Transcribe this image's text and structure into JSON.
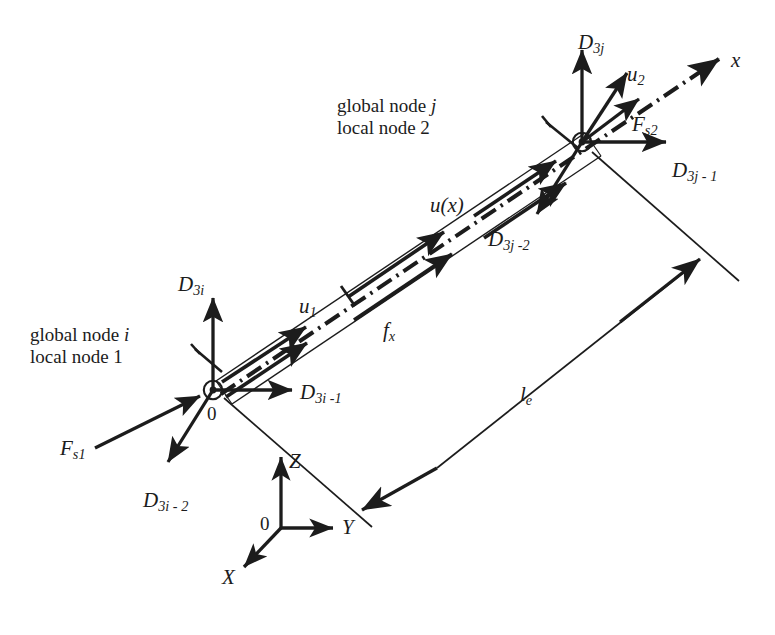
{
  "figure": {
    "background_color": "#ffffff",
    "ink_color": "#1c1c1c",
    "width": 775,
    "height": 635
  },
  "annotations": {
    "node_i_line1": "global node",
    "node_i_line1_italic": "i",
    "node_i_line2": "local node 1",
    "node_j_line1": "global node",
    "node_j_line1_italic": "j",
    "node_j_line2": "local node 2"
  },
  "labels": {
    "D3i": {
      "base": "D",
      "sub": "3i",
      "x": 178,
      "y": 272
    },
    "D3i_1": {
      "base": "D",
      "sub": "3i -1",
      "x": 300,
      "y": 380
    },
    "D3i_2": {
      "base": "D",
      "sub": "3i - 2",
      "x": 143,
      "y": 488
    },
    "Fs1": {
      "base": "F",
      "sub": "s1",
      "x": 60,
      "y": 436
    },
    "u1": {
      "base": "u",
      "sub": "1",
      "x": 299,
      "y": 294
    },
    "fx": {
      "base": "f",
      "sub": "x",
      "x": 383,
      "y": 318
    },
    "ux": {
      "base": "u(x)",
      "sub": "",
      "x": 430,
      "y": 193
    },
    "D3j": {
      "base": "D",
      "sub": "3j",
      "x": 578,
      "y": 30
    },
    "D3j_1": {
      "base": "D",
      "sub": "3j - 1",
      "x": 672,
      "y": 158
    },
    "D3j_2": {
      "base": "D",
      "sub": "3j -2",
      "x": 488,
      "y": 227
    },
    "Fs2": {
      "base": "F",
      "sub": "s2",
      "x": 632,
      "y": 112
    },
    "u2": {
      "base": "u",
      "sub": "2",
      "x": 627,
      "y": 62
    },
    "x_axis": {
      "base": "x",
      "sub": "",
      "x": 731,
      "y": 48
    },
    "le": {
      "base": "l",
      "sub": "e",
      "x": 520,
      "y": 382
    },
    "zero_left": {
      "base": "0",
      "x": 207,
      "y": 403
    },
    "zero_global": {
      "base": "0",
      "x": 260,
      "y": 513
    },
    "X_axis": {
      "base": "X",
      "x": 258,
      "y": 558
    },
    "Y_axis": {
      "base": "Y",
      "x": 345,
      "y": 523
    },
    "Z_axis": {
      "base": "Z",
      "x": 284,
      "y": 448
    }
  },
  "geometry": {
    "node_i": {
      "x": 213,
      "y": 390
    },
    "node_j": {
      "x": 582,
      "y": 142
    },
    "global_origin": {
      "x": 281,
      "y": 528
    },
    "beam_angle_deg": -33.9,
    "element_length_label": "le"
  },
  "legend": {
    "beam_representation": "double-line bar with dash-dot centerline",
    "local_axis": "x (dash-dot, arrow at far end)",
    "global_axes": [
      "X",
      "Y",
      "Z"
    ]
  }
}
